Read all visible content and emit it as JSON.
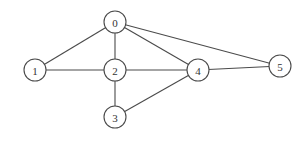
{
  "graph": {
    "type": "undirected",
    "nodes": [
      {
        "id": "0",
        "label": "0",
        "x": 115,
        "y": 22
      },
      {
        "id": "1",
        "label": "1",
        "x": 35,
        "y": 70
      },
      {
        "id": "2",
        "label": "2",
        "x": 115,
        "y": 70
      },
      {
        "id": "3",
        "label": "3",
        "x": 115,
        "y": 117
      },
      {
        "id": "4",
        "label": "4",
        "x": 198,
        "y": 70
      },
      {
        "id": "5",
        "label": "5",
        "x": 280,
        "y": 66
      }
    ],
    "edges": [
      {
        "from": "0",
        "to": "1"
      },
      {
        "from": "0",
        "to": "2"
      },
      {
        "from": "0",
        "to": "4"
      },
      {
        "from": "0",
        "to": "5"
      },
      {
        "from": "1",
        "to": "2"
      },
      {
        "from": "2",
        "to": "4"
      },
      {
        "from": "2",
        "to": "3"
      },
      {
        "from": "3",
        "to": "4"
      },
      {
        "from": "4",
        "to": "5"
      }
    ],
    "node_radius": 11,
    "colors": {
      "stroke": "#4a4a4a",
      "fill": "#ffffff",
      "label": "#333333"
    }
  }
}
